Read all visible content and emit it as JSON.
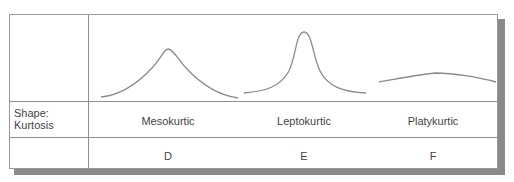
{
  "table": {
    "row_label": {
      "line1": "Shape:",
      "line2": "Kurtosis"
    },
    "columns": [
      {
        "shape": "mesokurtic-curve",
        "name": "Mesokurtic",
        "letter": "D"
      },
      {
        "shape": "leptokurtic-curve",
        "name": "Leptokurtic",
        "letter": "E"
      },
      {
        "shape": "platykurtic-curve",
        "name": "Platykurtic",
        "letter": "F"
      }
    ]
  },
  "colors": {
    "curve": "#8a8a8a",
    "border": "#8f8f8f",
    "shadow": "#8a8a8a",
    "text": "#444444"
  }
}
